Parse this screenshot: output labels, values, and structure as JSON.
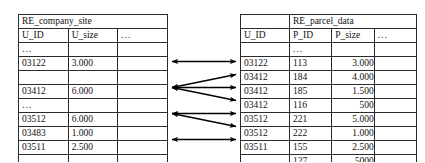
{
  "diagram": {
    "background_color": "#ffffff",
    "line_color": "#000000",
    "border_color": "#2b2b2b",
    "ellipsis": "...",
    "empty": ""
  },
  "left_table": {
    "name": "RE_company_site",
    "columns": [
      "U_ID",
      "U_size",
      "..."
    ],
    "rows": [
      {
        "kind": "ellipsis",
        "u_id": "...",
        "u_size": "",
        "rest": ""
      },
      {
        "kind": "data",
        "u_id": "03122",
        "u_size": "3.000",
        "rest": ""
      },
      {
        "kind": "spacer",
        "u_id": "",
        "u_size": "",
        "rest": ""
      },
      {
        "kind": "data",
        "u_id": "03412",
        "u_size": "6.000",
        "rest": ""
      },
      {
        "kind": "ellipsis",
        "u_id": "...",
        "u_size": "",
        "rest": ""
      },
      {
        "kind": "data",
        "u_id": "03512",
        "u_size": "6.000",
        "rest": ""
      },
      {
        "kind": "data",
        "u_id": "03483",
        "u_size": "1.000",
        "rest": ""
      },
      {
        "kind": "data",
        "u_id": "03511",
        "u_size": "2.500",
        "rest": ""
      },
      {
        "kind": "ellipsis",
        "u_id": "...",
        "u_size": "...",
        "rest": ""
      }
    ]
  },
  "right_table": {
    "name": "RE_parcel_data",
    "columns": [
      "U_ID",
      "P_ID",
      "P_size",
      "..."
    ],
    "rows": [
      {
        "kind": "ellipsis",
        "u_id": "",
        "p_id": "...",
        "p_size": "",
        "rest": ""
      },
      {
        "kind": "data",
        "u_id": "03122",
        "p_id": "113",
        "p_size": "3.000",
        "rest": ""
      },
      {
        "kind": "data",
        "u_id": "03412",
        "p_id": "184",
        "p_size": "4.000",
        "rest": ""
      },
      {
        "kind": "data",
        "u_id": "03412",
        "p_id": "185",
        "p_size": "1.500",
        "rest": ""
      },
      {
        "kind": "data",
        "u_id": "03412",
        "p_id": "116",
        "p_size": "500",
        "rest": ""
      },
      {
        "kind": "data",
        "u_id": "03512",
        "p_id": "221",
        "p_size": "5.000",
        "rest": ""
      },
      {
        "kind": "data",
        "u_id": "03512",
        "p_id": "222",
        "p_size": "1.000",
        "rest": ""
      },
      {
        "kind": "data",
        "u_id": "03511",
        "p_id": "155",
        "p_size": "2.500",
        "rest": ""
      },
      {
        "kind": "data",
        "u_id": "",
        "p_id": "127",
        "p_size": "5000",
        "rest": ""
      }
    ]
  },
  "links": [
    {
      "from_u_id": "03122",
      "to_u_id": "03122",
      "to_p_id": "113",
      "style": "double-headed"
    },
    {
      "from_u_id": "03412",
      "to_u_id": "03412",
      "to_p_id": "184",
      "style": "double-headed"
    },
    {
      "from_u_id": "03412",
      "to_u_id": "03412",
      "to_p_id": "185",
      "style": "double-headed"
    },
    {
      "from_u_id": "03412",
      "to_u_id": "03412",
      "to_p_id": "116",
      "style": "double-headed"
    },
    {
      "from_u_id": "03512",
      "to_u_id": "03512",
      "to_p_id": "221",
      "style": "double-headed"
    },
    {
      "from_u_id": "03512",
      "to_u_id": "03512",
      "to_p_id": "222",
      "style": "double-headed"
    },
    {
      "from_u_id": "03511",
      "to_u_id": "03511",
      "to_p_id": "155",
      "style": "double-headed"
    }
  ]
}
